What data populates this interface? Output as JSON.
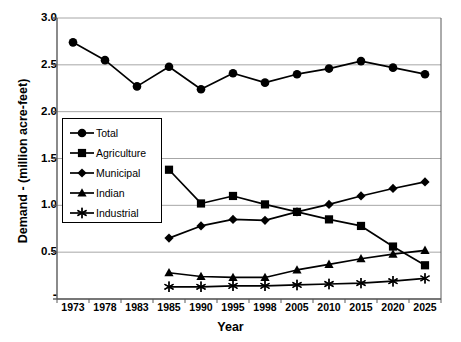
{
  "chart_data": {
    "type": "line",
    "title": "",
    "xlabel": "Year",
    "ylabel": "Demand - (million acre-feet)",
    "categories": [
      "1973",
      "1978",
      "1983",
      "1985",
      "1990",
      "1995",
      "1998",
      "2005",
      "2010",
      "2015",
      "2020",
      "2025"
    ],
    "ylim": [
      0,
      3.0
    ],
    "yticks": [
      "-",
      "0.5",
      "1.0",
      "1.5",
      "2.0",
      "2.5",
      "3.0"
    ],
    "ytick_values": [
      0,
      0.5,
      1.0,
      1.5,
      2.0,
      2.5,
      3.0
    ],
    "grid": true,
    "legend_position": "inside-left",
    "series": [
      {
        "name": "Total",
        "marker": "circle",
        "x": [
          "1973",
          "1978",
          "1983",
          "1985",
          "1990",
          "1995",
          "1998",
          "2005",
          "2010",
          "2015",
          "2020",
          "2025"
        ],
        "values": [
          2.74,
          2.55,
          2.27,
          2.48,
          2.24,
          2.41,
          2.31,
          2.4,
          2.46,
          2.54,
          2.47,
          2.4
        ]
      },
      {
        "name": "Agriculture",
        "marker": "square",
        "x": [
          "1985",
          "1990",
          "1995",
          "1998",
          "2005",
          "2010",
          "2015",
          "2020",
          "2025"
        ],
        "values": [
          1.38,
          1.02,
          1.1,
          1.01,
          0.93,
          0.85,
          0.78,
          0.56,
          0.36
        ]
      },
      {
        "name": "Municipal",
        "marker": "diamond",
        "x": [
          "1985",
          "1990",
          "1995",
          "1998",
          "2005",
          "2010",
          "2015",
          "2020",
          "2025"
        ],
        "values": [
          0.65,
          0.78,
          0.85,
          0.84,
          0.93,
          1.01,
          1.1,
          1.18,
          1.25
        ]
      },
      {
        "name": "Indian",
        "marker": "triangle",
        "x": [
          "1985",
          "1990",
          "1995",
          "1998",
          "2005",
          "2010",
          "2015",
          "2020",
          "2025"
        ],
        "values": [
          0.28,
          0.24,
          0.23,
          0.23,
          0.31,
          0.37,
          0.43,
          0.48,
          0.52
        ]
      },
      {
        "name": "Industrial",
        "marker": "asterisk",
        "x": [
          "1985",
          "1990",
          "1995",
          "1998",
          "2005",
          "2010",
          "2015",
          "2020",
          "2025"
        ],
        "values": [
          0.13,
          0.13,
          0.14,
          0.14,
          0.15,
          0.16,
          0.17,
          0.19,
          0.22
        ]
      }
    ]
  },
  "colors": {
    "series": "#000000",
    "grid": "#a6a6a6",
    "axis": "#595959",
    "background": "#ffffff"
  },
  "legend": {
    "items": [
      {
        "label": "Total",
        "marker": "circle"
      },
      {
        "label": "Agriculture",
        "marker": "square"
      },
      {
        "label": "Municipal",
        "marker": "diamond"
      },
      {
        "label": "Indian",
        "marker": "triangle"
      },
      {
        "label": "Industrial",
        "marker": "asterisk"
      }
    ]
  }
}
